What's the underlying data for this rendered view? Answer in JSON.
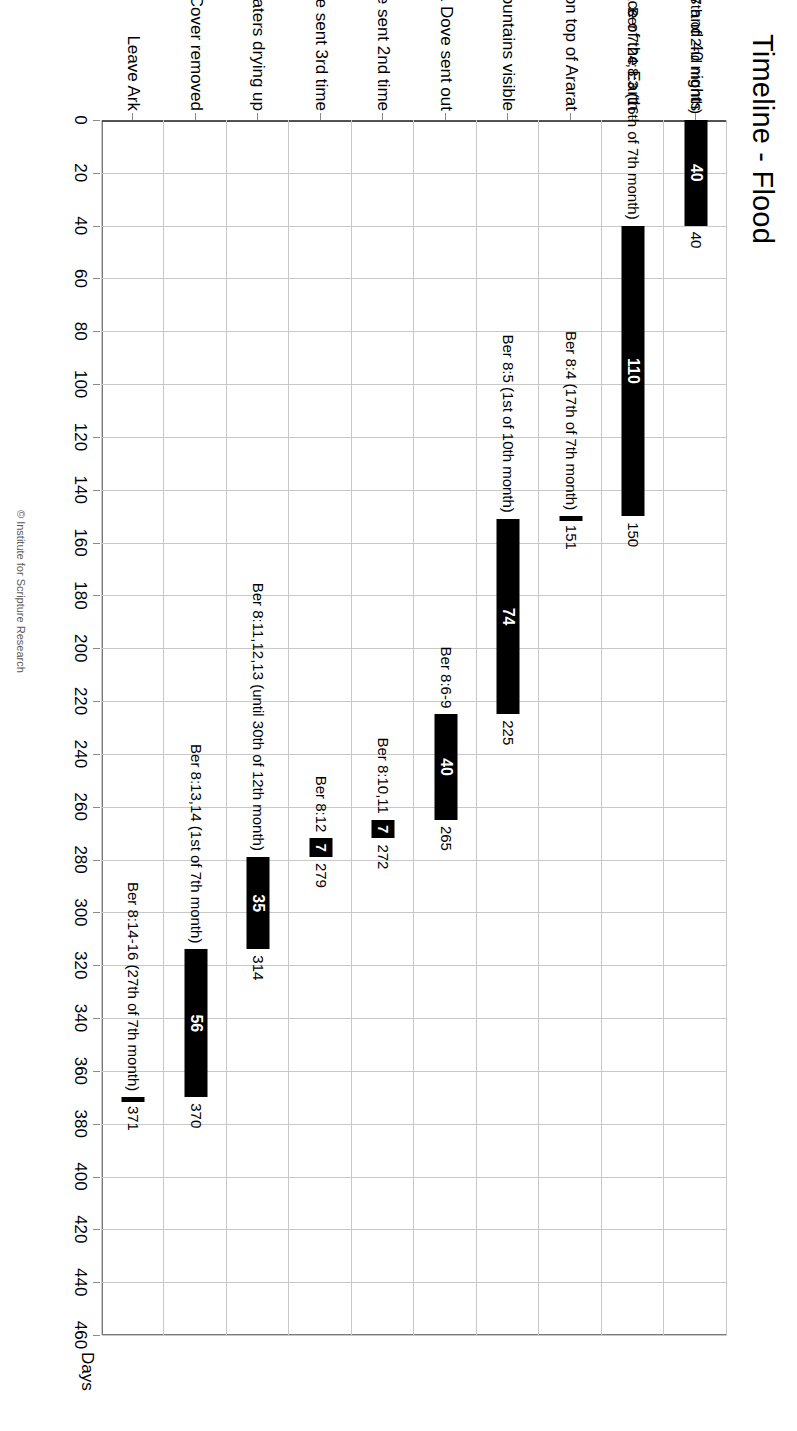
{
  "chart_data": {
    "type": "bar",
    "subtype": "gantt-floating-bar",
    "title": "Timeline - Flood",
    "xlabel": "Days",
    "ylabel": "",
    "orientation": "horizontal",
    "rotation_deg": 90,
    "grid": true,
    "legend": false,
    "xlim": [
      0,
      460
    ],
    "xtick_step": 20,
    "xticks": [
      "0",
      "20",
      "40",
      "60",
      "80",
      "100",
      "120",
      "140",
      "160",
      "180",
      "200",
      "220",
      "240",
      "260",
      "280",
      "300",
      "320",
      "340",
      "360",
      "380",
      "400",
      "420",
      "440",
      "460"
    ],
    "categories": [
      "Rain 40 days and 40 nights",
      "Waters on the face of the Earth",
      "Ark rests on top of Ararat",
      "Top of Mountains visible",
      "After 40 days Raven & Dove sent out",
      "Dove sent 2nd time",
      "Dove sent 3rd time",
      "Waters drying up",
      "Waters dry, Cover removed",
      "Leave Ark"
    ],
    "bars": [
      {
        "category": "Rain 40 days and 40 nights",
        "start": 0,
        "duration": 40,
        "end": 40,
        "duration_label": "40",
        "end_label": "40",
        "reference": "Ber 7:4,11,12 (Begins 17th of 2nd month)"
      },
      {
        "category": "Waters on the face of the Earth",
        "start": 40,
        "duration": 110,
        "end": 150,
        "duration_label": "110",
        "end_label": "150",
        "reference": "Ber 7:24;8:3 (16th of 7th month)"
      },
      {
        "category": "Ark rests on top of Ararat",
        "start": 150,
        "duration": 1,
        "end": 151,
        "duration_label": "",
        "end_label": "151",
        "reference": "Ber 8:4 (17th of 7th month)"
      },
      {
        "category": "Top of Mountains visible",
        "start": 151,
        "duration": 74,
        "end": 225,
        "duration_label": "74",
        "end_label": "225",
        "reference": "Ber 8:5 (1st of 10th month)"
      },
      {
        "category": "After 40 days Raven & Dove sent out",
        "start": 225,
        "duration": 40,
        "end": 265,
        "duration_label": "40",
        "end_label": "265",
        "reference": "Ber 8:6-9"
      },
      {
        "category": "Dove sent 2nd time",
        "start": 265,
        "duration": 7,
        "end": 272,
        "duration_label": "7",
        "end_label": "272",
        "reference": "Ber 8:10,11"
      },
      {
        "category": "Dove sent 3rd time",
        "start": 272,
        "duration": 7,
        "end": 279,
        "duration_label": "7",
        "end_label": "279",
        "reference": "Ber 8:12"
      },
      {
        "category": "Waters drying up",
        "start": 279,
        "duration": 35,
        "end": 314,
        "duration_label": "35",
        "end_label": "314",
        "reference": "Ber 8:11,12,13 (until 30th of 12th month)"
      },
      {
        "category": "Waters dry, Cover removed",
        "start": 314,
        "duration": 56,
        "end": 370,
        "duration_label": "56",
        "end_label": "370",
        "reference": "Ber 8:13,14 (1st of 7th month)"
      },
      {
        "category": "Leave Ark",
        "start": 370,
        "duration": 1,
        "end": 371,
        "duration_label": "",
        "end_label": "371",
        "reference": "Ber 8:14-16 (27th of 7th month)"
      }
    ],
    "colors": {
      "bar": "#000000",
      "grid": "#c8c8c8",
      "axis": "#7a7a7a",
      "text": "#000000",
      "background": "#ffffff"
    }
  },
  "footer": {
    "copyright": "© Institute for Scripture Research"
  }
}
